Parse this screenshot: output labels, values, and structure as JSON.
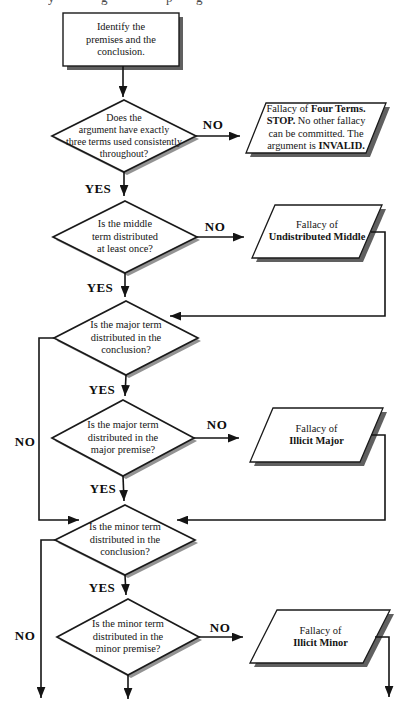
{
  "top_fragments": [
    "y",
    "g",
    "p",
    "g"
  ],
  "labels": {
    "yes": "YES",
    "no": "NO"
  },
  "nodes": {
    "start": {
      "lines": [
        "Identify the",
        "premises and the",
        "conclusion."
      ]
    },
    "d1": {
      "lines": [
        "Does the",
        "argument have exactly",
        "three terms used consistently",
        "throughout?"
      ]
    },
    "p1": {
      "l1a": "Fallacy of ",
      "l1b": "Four Terms.",
      "l2a": "STOP.",
      "l2b": " No other fallacy",
      "l3": "can be committed. The",
      "l4a": "argument is ",
      "l4b": "INVALID."
    },
    "d2": {
      "lines": [
        "Is the middle",
        "term distributed",
        "at least once?"
      ]
    },
    "p2": {
      "l1": "Fallacy of",
      "l2": "Undistributed Middle"
    },
    "d3": {
      "lines": [
        "Is the major term",
        "distributed in the",
        "conclusion?"
      ]
    },
    "d4": {
      "lines": [
        "Is the major term",
        "distributed in the",
        "major premise?"
      ]
    },
    "p3": {
      "l1": "Fallacy of",
      "l2": "Illicit Major"
    },
    "d5": {
      "lines": [
        "Is the minor term",
        "distributed in the",
        "conclusion?"
      ]
    },
    "d6": {
      "lines": [
        "Is the minor term",
        "distributed in the",
        "minor premise?"
      ]
    },
    "p4": {
      "l1": "Fallacy of",
      "l2": "Illicit Minor"
    }
  },
  "colors": {
    "ink": "#141414",
    "shape_fill": "#ffffff",
    "box_shadow": "#606060",
    "diamond_shadow": "#939393"
  }
}
